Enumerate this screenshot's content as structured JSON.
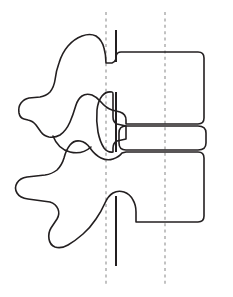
{
  "figure": {
    "background_color": "#ffffff",
    "outline_color": "#231f20",
    "axis_dashed_color": "#9a9a9a",
    "axis_solid_color": "#231f20",
    "canvas": {
      "width": 233,
      "height": 297
    }
  },
  "axes": {
    "anterior_dashed_line": {
      "label": "posterior reference axis",
      "x": 106,
      "y_top": 12,
      "y_bottom": 286,
      "style": "dashed"
    },
    "posterior_dashed_line": {
      "label": "mid-body reference axis",
      "x": 165,
      "y_top": 12,
      "y_bottom": 286,
      "style": "dashed"
    },
    "upper_solid_line": {
      "label": "upper vertebra axis marker",
      "x": 116,
      "y_top": 30,
      "y_bottom": 62,
      "style": "solid"
    },
    "canal_solid_line": {
      "label": "spinal canal axis marker",
      "x": 116,
      "y_top": 92,
      "y_bottom": 152,
      "style": "solid"
    },
    "lower_solid_line": {
      "label": "lower vertebra axis marker",
      "x": 116,
      "y_top": 196,
      "y_bottom": 266,
      "style": "solid"
    }
  },
  "structures": {
    "upper_vertebra": {
      "label": "upper vertebra",
      "body_label": "upper vertebral body",
      "body_bounds": {
        "left": 112,
        "right": 204,
        "top": 52,
        "bottom": 124
      },
      "spinous_process_tip_x": 22,
      "superior_articular_process_top_y": 32
    },
    "intervertebral_disc": {
      "label": "intervertebral disc",
      "bounds": {
        "left": 112,
        "right": 206,
        "top": 126,
        "bottom": 150
      }
    },
    "lower_vertebra": {
      "label": "lower vertebra",
      "body_label": "lower vertebral body",
      "body_bounds": {
        "left": 112,
        "right": 204,
        "top": 152,
        "bottom": 222
      },
      "spinous_process_tip_x": 16,
      "inferior_articular_process_bottom_y": 248
    },
    "facet_joint": {
      "label": "facet (zygapophyseal) joint",
      "center": {
        "x": 72,
        "y": 140
      }
    },
    "spinal_canal": {
      "label": "spinal canal / pedicle region",
      "center": {
        "x": 112,
        "y": 120
      }
    }
  }
}
